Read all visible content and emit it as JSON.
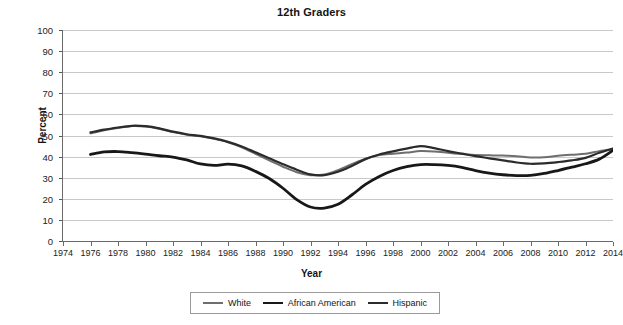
{
  "chart_data": {
    "type": "line",
    "title": "12th Graders",
    "xlabel": "Year",
    "ylabel": "Percent",
    "xlim": [
      1974,
      2014
    ],
    "ylim": [
      0,
      100
    ],
    "grid": true,
    "legend_position": "bottom",
    "xticks": [
      1974,
      1976,
      1978,
      1980,
      1982,
      1984,
      1986,
      1988,
      1990,
      1992,
      1994,
      1996,
      1998,
      2000,
      2002,
      2004,
      2006,
      2008,
      2010,
      2012,
      2014
    ],
    "yticks": [
      0,
      10,
      20,
      30,
      40,
      50,
      60,
      70,
      80,
      90,
      100
    ],
    "x": [
      1976,
      1977,
      1978,
      1979,
      1980,
      1981,
      1982,
      1983,
      1984,
      1985,
      1986,
      1987,
      1988,
      1989,
      1990,
      1991,
      1992,
      1993,
      1994,
      1995,
      1996,
      1997,
      1998,
      1999,
      2000,
      2001,
      2002,
      2003,
      2004,
      2005,
      2006,
      2007,
      2008,
      2009,
      2010,
      2011,
      2012,
      2013,
      2014
    ],
    "series": [
      {
        "name": "White",
        "color": "#6e6e6e",
        "width": 2.0,
        "values": [
          51,
          52.5,
          53.5,
          54.5,
          54.3,
          53.2,
          51.6,
          50.4,
          49.6,
          48.4,
          46.8,
          44.4,
          41.3,
          38.2,
          35.2,
          32.6,
          31.2,
          31.5,
          33.6,
          36.4,
          39.0,
          40.8,
          41.4,
          41.9,
          42.6,
          42.4,
          41.8,
          41.2,
          40.7,
          40.6,
          40.5,
          40.2,
          39.6,
          39.7,
          40.4,
          40.9,
          41.3,
          42.6,
          43.6
        ]
      },
      {
        "name": "African American",
        "color": "#181818",
        "width": 2.8,
        "values": [
          41,
          42.2,
          42.4,
          41.9,
          41.2,
          40.4,
          39.8,
          38.4,
          36.5,
          35.8,
          36.4,
          35.6,
          33.0,
          29.6,
          25.0,
          19.6,
          16.1,
          15.6,
          17.4,
          21.8,
          26.8,
          30.6,
          33.4,
          35.2,
          36.2,
          36.2,
          35.8,
          34.9,
          33.4,
          32.2,
          31.4,
          31.0,
          31.1,
          32.0,
          33.4,
          35.0,
          36.6,
          38.8,
          43.0
        ]
      },
      {
        "name": "Hispanic",
        "color": "#2b2b2b",
        "width": 2.2,
        "values": [
          51.5,
          52.8,
          53.8,
          54.6,
          54.4,
          53.4,
          51.8,
          50.6,
          49.8,
          48.6,
          47.0,
          44.8,
          42.0,
          39.2,
          36.4,
          33.8,
          31.6,
          31.2,
          32.8,
          35.6,
          38.8,
          41.0,
          42.5,
          43.8,
          45.0,
          44.0,
          42.6,
          41.4,
          40.2,
          39.2,
          38.2,
          37.2,
          36.6,
          36.8,
          37.4,
          38.2,
          39.4,
          41.8,
          43.8
        ]
      }
    ]
  },
  "legend": {
    "items": [
      {
        "label": "White"
      },
      {
        "label": "African American"
      },
      {
        "label": "Hispanic"
      }
    ]
  }
}
